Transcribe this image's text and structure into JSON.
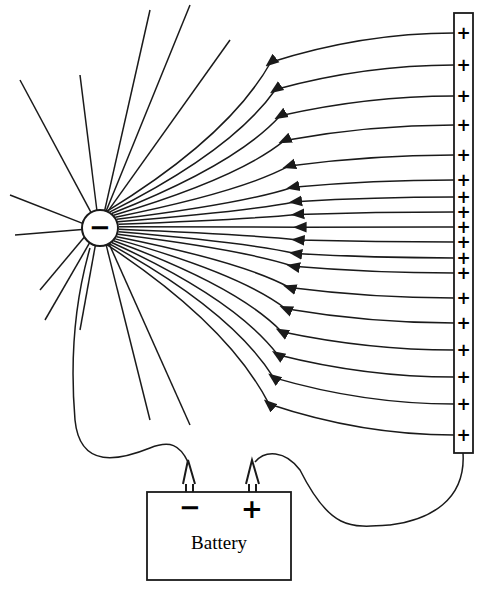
{
  "diagram": {
    "type": "electric-field-lines",
    "sphere": {
      "charge_symbol": "−",
      "cx": 100,
      "cy": 228,
      "r": 18
    },
    "plate": {
      "x": 454,
      "y": 13,
      "width": 19,
      "height": 440,
      "charge_symbol": "+",
      "plus_y": [
        33,
        65,
        96,
        125,
        155,
        180,
        197,
        212,
        227,
        242,
        258,
        273,
        298,
        323,
        350,
        377,
        404,
        435
      ]
    },
    "battery": {
      "label": "Battery",
      "negative_terminal": "−",
      "positive_terminal": "+"
    },
    "colors": {
      "line": "#1a1a1a",
      "background": "#ffffff"
    }
  }
}
